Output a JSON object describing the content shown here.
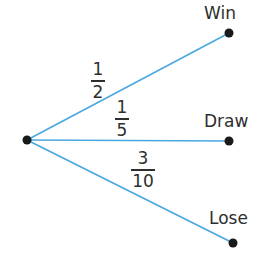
{
  "diagram": {
    "type": "probability-tree",
    "colors": {
      "branch": "#4aa8e0",
      "node": "#1a1a1a",
      "text": "#2e2e2e"
    },
    "root": {
      "x": 27,
      "y": 140
    },
    "branches": [
      {
        "outcome": "Win",
        "numerator": "1",
        "denominator": "2",
        "end": {
          "x": 229,
          "y": 33
        }
      },
      {
        "outcome": "Draw",
        "numerator": "1",
        "denominator": "5",
        "end": {
          "x": 229,
          "y": 141
        }
      },
      {
        "outcome": "Lose",
        "numerator": "3",
        "denominator": "10",
        "end": {
          "x": 233,
          "y": 243
        }
      }
    ]
  }
}
